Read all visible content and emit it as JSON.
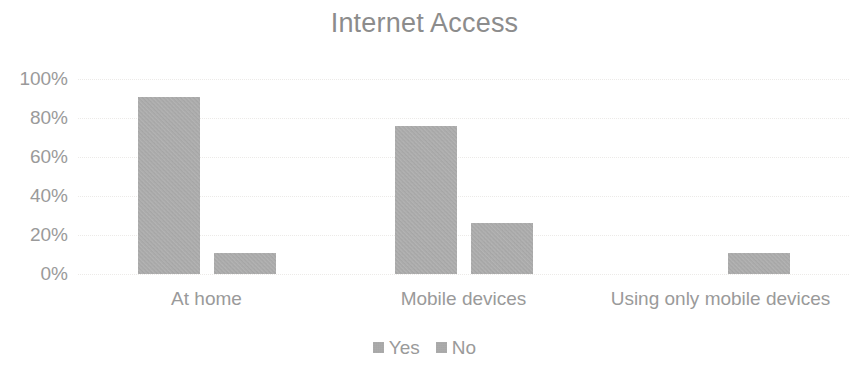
{
  "chart_data": {
    "type": "bar",
    "title": "Internet Access",
    "xlabel": "",
    "ylabel": "",
    "categories": [
      "At home",
      "Mobile devices",
      "Using only mobile devices"
    ],
    "series": [
      {
        "name": "Yes",
        "values": [
          91,
          76,
          0
        ],
        "color": "#a9a9a9"
      },
      {
        "name": "No",
        "values": [
          11,
          26,
          11
        ],
        "color": "#a9a9a9"
      }
    ],
    "ylim": [
      0,
      100
    ],
    "y_ticks": [
      0,
      20,
      40,
      60,
      80,
      100
    ],
    "y_tick_labels": [
      "0%",
      "20%",
      "40%",
      "60%",
      "80%",
      "100%"
    ],
    "grid": true,
    "grid_axis": "y",
    "legend_position": "bottom",
    "value_unit": "%",
    "bar_color": "#a9a9a9",
    "text_color": "#9a9a9a",
    "title_color": "#8c8c8c",
    "background_color": "#ffffff"
  }
}
